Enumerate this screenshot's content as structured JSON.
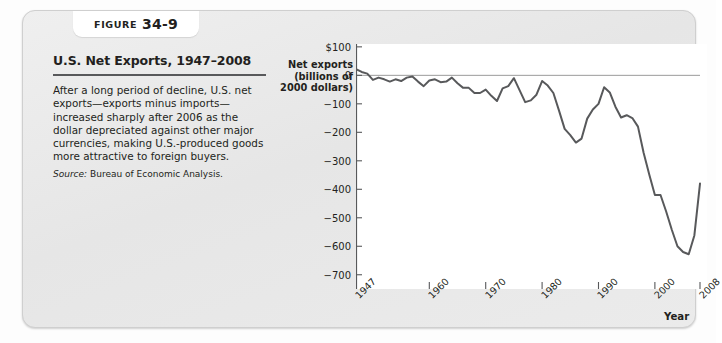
{
  "figure": {
    "badge_word": "Figure",
    "badge_number": "34-9",
    "title": "U.S. Net Exports, 1947–2008",
    "body": "After a long period of decline, U.S. net exports—exports minus imports—increased sharply after 2006 as the dollar depreciated against other major currencies, making U.S.-produced goods more attractive to foreign buyers.",
    "source_label": "Source:",
    "source_text": "Bureau of Economic Analysis."
  },
  "chart_data": {
    "type": "line",
    "title": "U.S. Net Exports, 1947–2008",
    "ylabel": "Net exports (billions of 2000 dollars)",
    "ylabel_lines": [
      "Net exports",
      "(billions of",
      "2000 dollars)"
    ],
    "xlabel": "Year",
    "ylim": [
      -750,
      110
    ],
    "xlim": [
      1947,
      2008
    ],
    "ytick_labels": [
      "$100",
      "0",
      "−100",
      "−200",
      "−300",
      "−400",
      "−500",
      "−600",
      "−700"
    ],
    "yticks": [
      100,
      0,
      -100,
      -200,
      -300,
      -400,
      -500,
      -600,
      -700
    ],
    "xtick_labels": [
      "1947",
      "1960",
      "1970",
      "1980",
      "1990",
      "2000",
      "2008"
    ],
    "xticks": [
      1947,
      1960,
      1970,
      1980,
      1990,
      2000,
      2008
    ],
    "grid": false,
    "zero_line": true,
    "legend": null,
    "series_name": "Net exports",
    "line_color": "#58595b",
    "x": [
      1947,
      1948,
      1949,
      1950,
      1951,
      1952,
      1953,
      1954,
      1955,
      1956,
      1957,
      1958,
      1959,
      1960,
      1961,
      1962,
      1963,
      1964,
      1965,
      1966,
      1967,
      1968,
      1969,
      1970,
      1971,
      1972,
      1973,
      1974,
      1975,
      1976,
      1977,
      1978,
      1979,
      1980,
      1981,
      1982,
      1983,
      1984,
      1985,
      1986,
      1987,
      1988,
      1989,
      1990,
      1991,
      1992,
      1993,
      1994,
      1995,
      1996,
      1997,
      1998,
      1999,
      2000,
      2001,
      2002,
      2003,
      2004,
      2005,
      2006,
      2007,
      2008
    ],
    "values": [
      22,
      12,
      6,
      -16,
      -8,
      -14,
      -22,
      -14,
      -20,
      -8,
      -4,
      -22,
      -38,
      -18,
      -14,
      -24,
      -22,
      -8,
      -28,
      -44,
      -44,
      -62,
      -62,
      -50,
      -72,
      -90,
      -46,
      -38,
      -10,
      -52,
      -94,
      -88,
      -68,
      -20,
      -36,
      -62,
      -124,
      -188,
      -210,
      -236,
      -222,
      -152,
      -120,
      -100,
      -42,
      -60,
      -110,
      -148,
      -140,
      -150,
      -180,
      -272,
      -348,
      -420,
      -420,
      -478,
      -542,
      -600,
      -620,
      -628,
      -562,
      -380
    ],
    "annotations": [
      {
        "text": "Peak near zero in 1947–1948, small surplus"
      },
      {
        "text": "Mid-1980s trough near −236 (1986)"
      },
      {
        "text": "Recovery toward zero in 1991"
      },
      {
        "text": "Steep decline after 1997 to trough −628 (2006)"
      },
      {
        "text": "Sharp increase after 2006 to −380 (2008)"
      }
    ]
  }
}
